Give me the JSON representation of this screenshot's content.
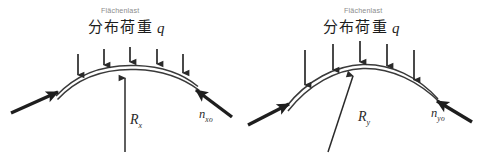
{
  "figure": {
    "title_german": "Flächenlast",
    "title_japanese": "分布荷重",
    "load_symbol": "q",
    "panels": [
      {
        "id": "x-direction",
        "german_label": "Flächenlast",
        "japanese_label": "分布荷重",
        "load_symbol": "q",
        "radius_label": "R",
        "radius_subscript": "x",
        "thrust_label": "n",
        "thrust_subscript": "xo",
        "load_arrow_count": 5,
        "curve_description": "shallow-arch-double-line",
        "arch_rise_px": 24
      },
      {
        "id": "y-direction",
        "german_label": "Flächenlast",
        "japanese_label": "分布荷重",
        "load_symbol": "q",
        "radius_label": "R",
        "radius_subscript": "y",
        "thrust_label": "n",
        "thrust_subscript": "yo",
        "load_arrow_count": 5,
        "curve_description": "steeper-arch-double-line",
        "arch_rise_px": 34
      }
    ],
    "colors": {
      "background": "#ffffff",
      "line": "#2a2a2a",
      "shell": "#3a3a3a",
      "german_text": "#8c8c8c",
      "japanese_text": "#1c1c1c",
      "math_text": "#2b2b2b"
    }
  }
}
